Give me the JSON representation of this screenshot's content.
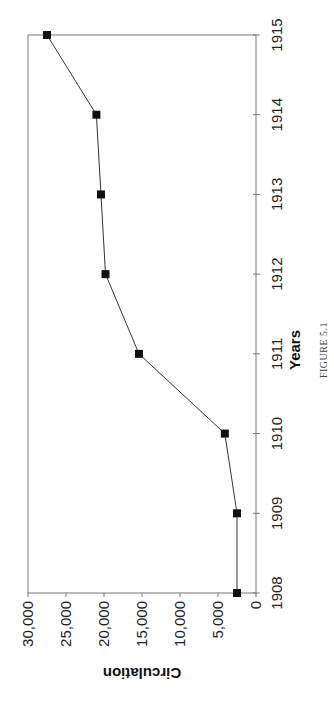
{
  "chart_data": {
    "type": "line",
    "orientation": "rotated-90-clockwise",
    "title": "",
    "caption": "FIGURE 5.1",
    "xlabel": "Years",
    "ylabel": "Circulation",
    "x": [
      1908,
      1909,
      1910,
      1911,
      1912,
      1913,
      1914,
      1915
    ],
    "categories": [
      "1908",
      "1909",
      "1910",
      "1911",
      "1912",
      "1913",
      "1914",
      "1915"
    ],
    "series": [
      {
        "name": "Circulation",
        "values": [
          2500,
          2500,
          4100,
          15400,
          19800,
          20400,
          21000,
          27500
        ],
        "marker": "square",
        "color": "#111111"
      }
    ],
    "ylim": [
      0,
      30000
    ],
    "yticks": [
      "0",
      "5,000",
      "10,000",
      "15,000",
      "20,000",
      "25,000",
      "30,000"
    ],
    "grid": false,
    "legend": "none"
  }
}
